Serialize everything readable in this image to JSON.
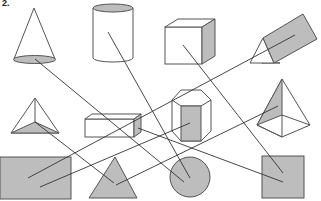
{
  "figure": {
    "label": "2.",
    "colors": {
      "fill": "#bdbdbd",
      "stroke": "#555555",
      "line": "#333333",
      "background": "#ffffff"
    },
    "solids_3d": [
      {
        "id": "cone",
        "name": "Cone"
      },
      {
        "id": "cylinder",
        "name": "Cylinder"
      },
      {
        "id": "cube",
        "name": "Cube"
      },
      {
        "id": "triangular-prism",
        "name": "Triangular prism"
      },
      {
        "id": "tetrahedron",
        "name": "Triangular pyramid"
      },
      {
        "id": "cuboid",
        "name": "Rectangular prism"
      },
      {
        "id": "hexagonal-prism",
        "name": "Hexagonal prism"
      },
      {
        "id": "square-pyramid",
        "name": "Square pyramid"
      }
    ],
    "shapes_2d": [
      {
        "id": "rectangle",
        "name": "Rectangle"
      },
      {
        "id": "triangle",
        "name": "Triangle"
      },
      {
        "id": "circle",
        "name": "Circle"
      },
      {
        "id": "square",
        "name": "Square"
      }
    ],
    "connections": [
      {
        "from": "cone",
        "to": "circle"
      },
      {
        "from": "cylinder",
        "to": "circle"
      },
      {
        "from": "cube",
        "to": "square"
      },
      {
        "from": "triangular-prism",
        "to": "rectangle"
      },
      {
        "from": "tetrahedron",
        "to": "triangle"
      },
      {
        "from": "cuboid",
        "to": "square"
      },
      {
        "from": "hexagonal-prism",
        "to": "rectangle"
      },
      {
        "from": "square-pyramid",
        "to": "triangle"
      }
    ]
  }
}
